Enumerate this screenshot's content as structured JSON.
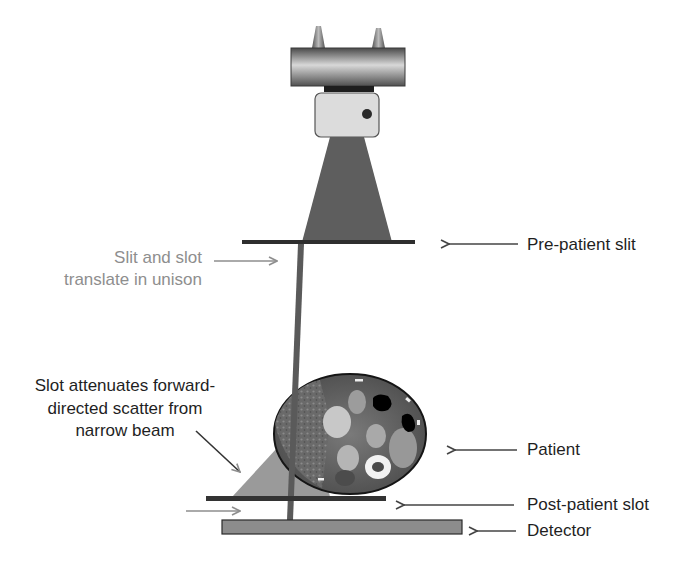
{
  "figure": {
    "colors": {
      "tube_dark": "#5a5a5a",
      "tube_light": "#d4d4d4",
      "housing": "#d9d9d9",
      "beam": "#5f5f5f",
      "slit": "#2e2e2e",
      "scatter_wedge": "#9a9a9a",
      "detector": "#8a8a8a",
      "patient_outline": "#1a1a1a",
      "patient_fill": "#6e6e6e",
      "arrow_dark": "#444444",
      "arrow_gray": "#8e8e8e",
      "text_dark": "#1f1f1f",
      "text_gray": "#8e8e8e"
    }
  },
  "labels": {
    "pre_patient_slit": "Pre-patient slit",
    "translate_line1": "Slit and slot",
    "translate_line2": "translate in unison",
    "scatter_line1": "Slot attenuates forward-",
    "scatter_line2": "directed scatter from",
    "scatter_line3": "narrow beam",
    "patient": "Patient",
    "post_patient_slot": "Post-patient slot",
    "detector": "Detector"
  },
  "components": [
    {
      "id": "xray-tube",
      "name": "X-ray tube"
    },
    {
      "id": "collimator-housing",
      "name": "Collimator housing"
    },
    {
      "id": "pre-patient-slit",
      "name": "Pre-patient slit"
    },
    {
      "id": "narrow-beam",
      "name": "Narrow beam"
    },
    {
      "id": "patient",
      "name": "Patient (axial CT cross-section)"
    },
    {
      "id": "post-patient-slot",
      "name": "Post-patient slot"
    },
    {
      "id": "detector",
      "name": "Detector"
    }
  ]
}
